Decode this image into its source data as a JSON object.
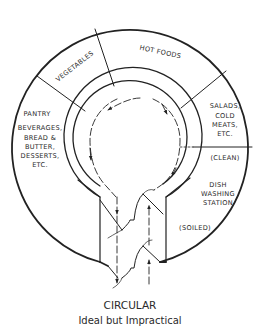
{
  "diagram": {
    "sections": {
      "hot_foods": "HOT FOODS",
      "vegetables": "VEGETABLES",
      "pantry": {
        "title": "PANTRY",
        "lines": [
          "BEVERAGES,",
          "BREAD &",
          "BUTTER,",
          "DESSERTS,",
          "ETC."
        ]
      },
      "salads": {
        "lines": [
          "SALADS,",
          "COLD",
          "MEATS,",
          "ETC."
        ]
      },
      "clean": "(CLEAN)",
      "dish_washing": {
        "lines": [
          "DISH",
          "WASHING",
          "STATION"
        ]
      },
      "soiled": "(SOILED)"
    },
    "caption": {
      "title": "CIRCULAR",
      "subtitle": "Ideal but Impractical"
    },
    "colors": {
      "line": "#222222",
      "text": "#2a2a2a",
      "background": "#ffffff"
    }
  }
}
